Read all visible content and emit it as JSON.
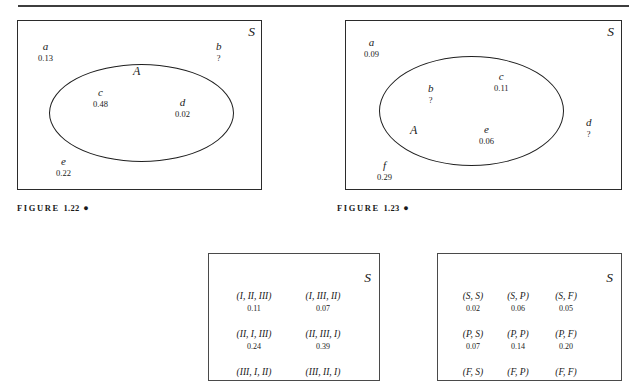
{
  "document": {
    "type": "textbook-figure-page",
    "rule_visible": true
  },
  "figures": [
    {
      "id": "figure-1-22",
      "caption_prefix": "FIGURE",
      "caption_number": "1.22",
      "caption_marker": "●",
      "sample_space_label": "S",
      "set_label": "A",
      "outcomes": [
        {
          "name": "a",
          "value": "0.13",
          "inside_set": false
        },
        {
          "name": "b",
          "value": "?",
          "inside_set": false
        },
        {
          "name": "c",
          "value": "0.48",
          "inside_set": true
        },
        {
          "name": "d",
          "value": "0.02",
          "inside_set": true
        },
        {
          "name": "e",
          "value": "0.22",
          "inside_set": false
        }
      ]
    },
    {
      "id": "figure-1-23",
      "caption_prefix": "FIGURE",
      "caption_number": "1.23",
      "caption_marker": "●",
      "sample_space_label": "S",
      "set_label": "A",
      "outcomes": [
        {
          "name": "a",
          "value": "0.09",
          "inside_set": false
        },
        {
          "name": "b",
          "value": "?",
          "inside_set": true
        },
        {
          "name": "c",
          "value": "0.11",
          "inside_set": true
        },
        {
          "name": "d",
          "value": "?",
          "inside_set": false
        },
        {
          "name": "e",
          "value": "0.06",
          "inside_set": true
        },
        {
          "name": "f",
          "value": "0.29",
          "inside_set": false
        }
      ]
    },
    {
      "id": "figure-permutations",
      "sample_space_label": "S",
      "grid": [
        [
          {
            "outcome": "(I, II, III)",
            "value": "0.11"
          },
          {
            "outcome": "(I, III, II)",
            "value": "0.07"
          }
        ],
        [
          {
            "outcome": "(II, I, III)",
            "value": "0.24"
          },
          {
            "outcome": "(II, III, I)",
            "value": "0.39"
          }
        ],
        [
          {
            "outcome": "(III, I, II)",
            "value": ""
          },
          {
            "outcome": "(III, II, I)",
            "value": ""
          }
        ]
      ]
    },
    {
      "id": "figure-pairs",
      "sample_space_label": "S",
      "grid": [
        [
          {
            "outcome": "(S, S)",
            "value": "0.02"
          },
          {
            "outcome": "(S, P)",
            "value": "0.06"
          },
          {
            "outcome": "(S, F)",
            "value": "0.05"
          }
        ],
        [
          {
            "outcome": "(P, S)",
            "value": "0.07"
          },
          {
            "outcome": "(P, P)",
            "value": "0.14"
          },
          {
            "outcome": "(P, F)",
            "value": "0.20"
          }
        ],
        [
          {
            "outcome": "(F, S)",
            "value": ""
          },
          {
            "outcome": "(F, P)",
            "value": ""
          },
          {
            "outcome": "(F, F)",
            "value": ""
          }
        ]
      ]
    }
  ]
}
